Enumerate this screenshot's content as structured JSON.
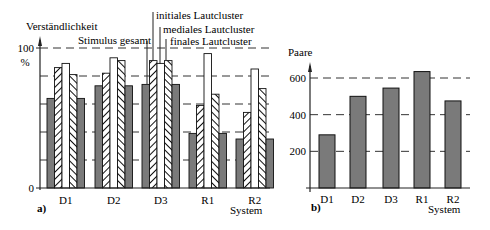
{
  "chart_data": [
    {
      "panel": "a)",
      "type": "bar",
      "title": "",
      "ylabel": "Verständlichkeit",
      "yunit": "%",
      "xlabel": "System",
      "categories": [
        "D1",
        "D2",
        "D3",
        "R1",
        "R2"
      ],
      "ylim": [
        0,
        100
      ],
      "yticks": [
        0,
        100
      ],
      "grid": true,
      "grid_lines": [
        20,
        40,
        60,
        80,
        100
      ],
      "series": [
        {
          "name": "Stimulus gesamt",
          "pattern": "solid-gray",
          "values": [
            64,
            73,
            74,
            39,
            35
          ]
        },
        {
          "name": "initiales Lautcluster",
          "pattern": "hatch-right",
          "values": [
            86,
            82,
            91,
            59,
            54
          ]
        },
        {
          "name": "mediales Lautcluster",
          "pattern": "white",
          "values": [
            89,
            93,
            89,
            96,
            85
          ]
        },
        {
          "name": "finales Lautcluster",
          "pattern": "hatch-left",
          "values": [
            81,
            91,
            91,
            67,
            71
          ]
        },
        {
          "name": "Stimulus gesamt",
          "pattern": "solid-gray",
          "values": [
            64,
            73,
            74,
            39,
            35
          ]
        }
      ],
      "legend_labels": [
        "Stimulus gesamt",
        "initiales Lautcluster",
        "mediales Lautcluster",
        "finales Lautcluster"
      ],
      "legend_position": "callouts above D3"
    },
    {
      "panel": "b)",
      "type": "bar",
      "title": "",
      "ylabel": "Paare",
      "xlabel": "System",
      "categories": [
        "D1",
        "D2",
        "D3",
        "R1",
        "R2"
      ],
      "values": [
        290,
        500,
        545,
        635,
        475
      ],
      "ylim": [
        0,
        700
      ],
      "yticks": [
        200,
        400,
        600
      ],
      "grid": true
    }
  ],
  "panelA": {
    "label": "a)",
    "ylabel": "Verständlichkeit",
    "yunit": "%",
    "ytick_top": "100",
    "ytick_bottom": "0",
    "xlabel": "System",
    "categories": [
      "D1",
      "D2",
      "D3",
      "R1",
      "R2"
    ],
    "legend": {
      "gesamt": "Stimulus gesamt",
      "initial": "initiales Lautcluster",
      "medial": "mediales Lautcluster",
      "final": "finales Lautcluster"
    }
  },
  "panelB": {
    "label": "b)",
    "ylabel": "Paare",
    "yticks": [
      "200",
      "400",
      "600"
    ],
    "xlabel": "System",
    "categories": [
      "D1",
      "D2",
      "D3",
      "R1",
      "R2"
    ]
  },
  "colors": {
    "bar_fill": "#7a7a7a",
    "axis": "#222222",
    "grid": "#333333"
  }
}
